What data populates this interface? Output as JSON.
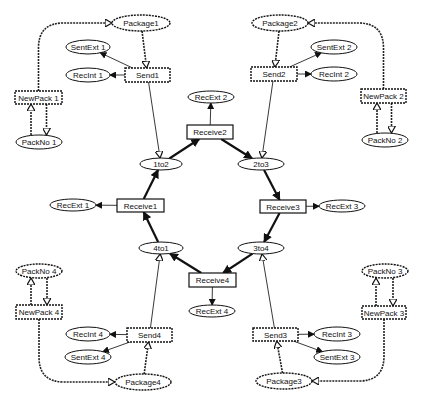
{
  "diagram": {
    "type": "petri-net",
    "places": [
      {
        "id": "package1",
        "label": "Package1",
        "cx": 141,
        "cy": 23,
        "rx": 29,
        "ry": 8,
        "dashed": true
      },
      {
        "id": "package2",
        "label": "Package2",
        "cx": 280,
        "cy": 23,
        "rx": 28,
        "ry": 8,
        "dashed": true
      },
      {
        "id": "package3",
        "label": "Package3",
        "cx": 284,
        "cy": 381,
        "rx": 28,
        "ry": 8,
        "dashed": true
      },
      {
        "id": "package4",
        "label": "Package4",
        "cx": 143,
        "cy": 382,
        "rx": 28,
        "ry": 8,
        "dashed": true
      },
      {
        "id": "sentext1",
        "label": "SentExt 1",
        "cx": 88,
        "cy": 47,
        "rx": 22,
        "ry": 7,
        "dashed": false
      },
      {
        "id": "recint1",
        "label": "RecInt 1",
        "cx": 88,
        "cy": 75,
        "rx": 22,
        "ry": 7,
        "dashed": false
      },
      {
        "id": "sentext2",
        "label": "SentExt 2",
        "cx": 334,
        "cy": 47,
        "rx": 23,
        "ry": 7,
        "dashed": false
      },
      {
        "id": "recint2",
        "label": "RecInt 2",
        "cx": 334,
        "cy": 74,
        "rx": 23,
        "ry": 7,
        "dashed": false
      },
      {
        "id": "recint3",
        "label": "RecInt 3",
        "cx": 337,
        "cy": 334,
        "rx": 23,
        "ry": 7,
        "dashed": false
      },
      {
        "id": "sentext3",
        "label": "SentExt 3",
        "cx": 337,
        "cy": 357,
        "rx": 23,
        "ry": 7,
        "dashed": false
      },
      {
        "id": "recint4",
        "label": "RecInt 4",
        "cx": 88,
        "cy": 334,
        "rx": 22,
        "ry": 7,
        "dashed": false
      },
      {
        "id": "sentext4",
        "label": "SentExt 4",
        "cx": 88,
        "cy": 357,
        "rx": 23,
        "ry": 7,
        "dashed": false
      },
      {
        "id": "packno1",
        "label": "PackNo 1",
        "cx": 39,
        "cy": 142,
        "rx": 23,
        "ry": 7,
        "dashed": false
      },
      {
        "id": "packno2",
        "label": "PackNo 2",
        "cx": 385,
        "cy": 140,
        "rx": 23,
        "ry": 7,
        "dashed": false
      },
      {
        "id": "packno3",
        "label": "PackNo 3",
        "cx": 385,
        "cy": 271,
        "rx": 23,
        "ry": 7,
        "dashed": true
      },
      {
        "id": "packno4",
        "label": "PackNo 4",
        "cx": 39,
        "cy": 271,
        "rx": 23,
        "ry": 7,
        "dashed": true
      },
      {
        "id": "1to2",
        "label": "1to2",
        "cx": 161,
        "cy": 164,
        "rx": 21,
        "ry": 6,
        "dashed": false
      },
      {
        "id": "2to3",
        "label": "2to3",
        "cx": 261,
        "cy": 164,
        "rx": 23,
        "ry": 6,
        "dashed": false
      },
      {
        "id": "3to4",
        "label": "3to4",
        "cx": 261,
        "cy": 248,
        "rx": 23,
        "ry": 6,
        "dashed": false
      },
      {
        "id": "4to1",
        "label": "4to1",
        "cx": 161,
        "cy": 248,
        "rx": 22,
        "ry": 6,
        "dashed": false
      },
      {
        "id": "recext1",
        "label": "RecExt 1",
        "cx": 73,
        "cy": 205,
        "rx": 23,
        "ry": 6,
        "dashed": false
      },
      {
        "id": "recext2",
        "label": "RecExt 2",
        "cx": 211,
        "cy": 97,
        "rx": 23,
        "ry": 6,
        "dashed": false
      },
      {
        "id": "recext3",
        "label": "RecExt 3",
        "cx": 342,
        "cy": 206,
        "rx": 23,
        "ry": 6,
        "dashed": false
      },
      {
        "id": "recext4",
        "label": "RecExt 4",
        "cx": 212,
        "cy": 311,
        "rx": 23,
        "ry": 6,
        "dashed": false
      }
    ],
    "transitions": [
      {
        "id": "send1",
        "label": "Send1",
        "x": 125,
        "y": 68,
        "w": 45,
        "h": 14,
        "dashed": true
      },
      {
        "id": "send2",
        "label": "Send2",
        "x": 251,
        "y": 67,
        "w": 46,
        "h": 14,
        "dashed": true
      },
      {
        "id": "send3",
        "label": "Send3",
        "x": 253,
        "y": 328,
        "w": 45,
        "h": 13,
        "dashed": true
      },
      {
        "id": "send4",
        "label": "Send4",
        "x": 127,
        "y": 328,
        "w": 45,
        "h": 14,
        "dashed": true
      },
      {
        "id": "newpack1",
        "label": "NewPack 1",
        "x": 15,
        "y": 91,
        "w": 47,
        "h": 13,
        "dashed": true
      },
      {
        "id": "newpack2",
        "label": "NewPack 2",
        "x": 361,
        "y": 89,
        "w": 45,
        "h": 14,
        "dashed": true
      },
      {
        "id": "newpack3",
        "label": "NewPack 3",
        "x": 362,
        "y": 306,
        "w": 44,
        "h": 13,
        "dashed": true
      },
      {
        "id": "newpack4",
        "label": "NewPack 4",
        "x": 16,
        "y": 305,
        "w": 46,
        "h": 14,
        "dashed": true
      },
      {
        "id": "receive1",
        "label": "Receive1",
        "x": 117,
        "y": 199,
        "w": 47,
        "h": 13,
        "dashed": false
      },
      {
        "id": "receive2",
        "label": "Receive2",
        "x": 187,
        "y": 125,
        "w": 46,
        "h": 14,
        "dashed": false
      },
      {
        "id": "receive3",
        "label": "Receive3",
        "x": 260,
        "y": 200,
        "w": 46,
        "h": 13,
        "dashed": false
      },
      {
        "id": "receive4",
        "label": "Receive4",
        "x": 189,
        "y": 273,
        "w": 47,
        "h": 14,
        "dashed": false
      }
    ],
    "arcs": [
      {
        "from": "package1",
        "to": "send1",
        "style": "dashed"
      },
      {
        "from": "send1",
        "to": "sentext1",
        "style": "thin"
      },
      {
        "from": "send1",
        "to": "recint1",
        "style": "thin"
      },
      {
        "from": "send1",
        "to": "1to2",
        "style": "thin"
      },
      {
        "from": "newpack1",
        "to": "package1",
        "style": "dashed-curve"
      },
      {
        "from": "packno1",
        "to": "newpack1",
        "style": "dashed"
      },
      {
        "from": "newpack1",
        "to": "packno1",
        "style": "dashed"
      },
      {
        "from": "package2",
        "to": "send2",
        "style": "dashed"
      },
      {
        "from": "send2",
        "to": "sentext2",
        "style": "thin"
      },
      {
        "from": "send2",
        "to": "recint2",
        "style": "thin"
      },
      {
        "from": "send2",
        "to": "2to3",
        "style": "thin"
      },
      {
        "from": "newpack2",
        "to": "package2",
        "style": "dashed-curve"
      },
      {
        "from": "packno2",
        "to": "newpack2",
        "style": "dashed"
      },
      {
        "from": "newpack2",
        "to": "packno2",
        "style": "dashed"
      },
      {
        "from": "package3",
        "to": "send3",
        "style": "dashed"
      },
      {
        "from": "send3",
        "to": "recint3",
        "style": "thin"
      },
      {
        "from": "send3",
        "to": "sentext3",
        "style": "thin"
      },
      {
        "from": "send3",
        "to": "3to4",
        "style": "thin"
      },
      {
        "from": "newpack3",
        "to": "package3",
        "style": "dashed-curve"
      },
      {
        "from": "packno3",
        "to": "newpack3",
        "style": "dashed"
      },
      {
        "from": "newpack3",
        "to": "packno3",
        "style": "dashed"
      },
      {
        "from": "package4",
        "to": "send4",
        "style": "dashed"
      },
      {
        "from": "send4",
        "to": "recint4",
        "style": "thin"
      },
      {
        "from": "send4",
        "to": "sentext4",
        "style": "thin"
      },
      {
        "from": "send4",
        "to": "4to1",
        "style": "thin"
      },
      {
        "from": "newpack4",
        "to": "package4",
        "style": "dashed-curve"
      },
      {
        "from": "packno4",
        "to": "newpack4",
        "style": "dashed"
      },
      {
        "from": "newpack4",
        "to": "packno4",
        "style": "dashed"
      },
      {
        "from": "1to2",
        "to": "receive2",
        "style": "thick"
      },
      {
        "from": "receive2",
        "to": "2to3",
        "style": "thick"
      },
      {
        "from": "receive2",
        "to": "recext2",
        "style": "thin"
      },
      {
        "from": "2to3",
        "to": "receive3",
        "style": "thick"
      },
      {
        "from": "receive3",
        "to": "3to4",
        "style": "thick"
      },
      {
        "from": "receive3",
        "to": "recext3",
        "style": "thin"
      },
      {
        "from": "3to4",
        "to": "receive4",
        "style": "thick"
      },
      {
        "from": "receive4",
        "to": "4to1",
        "style": "thick"
      },
      {
        "from": "receive4",
        "to": "recext4",
        "style": "thin"
      },
      {
        "from": "4to1",
        "to": "receive1",
        "style": "thick"
      },
      {
        "from": "receive1",
        "to": "1to2",
        "style": "thick"
      },
      {
        "from": "receive1",
        "to": "recext1",
        "style": "thin"
      }
    ]
  }
}
